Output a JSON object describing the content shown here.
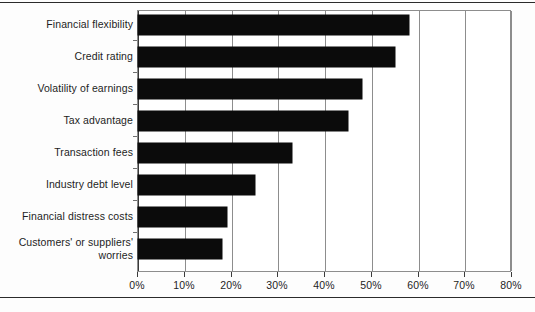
{
  "chart_data": {
    "type": "bar",
    "orientation": "horizontal",
    "title": "",
    "subtitle": "",
    "xlabel": "",
    "ylabel": "",
    "xlim": [
      0,
      80
    ],
    "ylim": null,
    "grid": true,
    "legend": null,
    "legend_position": "none",
    "categories": [
      "Financial flexibility",
      "Credit rating",
      "Volatility of earnings",
      "Tax advantage",
      "Transaction fees",
      "Industry debt level",
      "Financial distress costs",
      "Customers' or suppliers'\nworries"
    ],
    "values": [
      58,
      55,
      48,
      45,
      33,
      25,
      19,
      18
    ],
    "value_unit": "%",
    "xticks": [
      0,
      10,
      20,
      30,
      40,
      50,
      60,
      70,
      80
    ],
    "xtick_labels": [
      "0%",
      "10%",
      "20%",
      "30%",
      "40%",
      "50%",
      "60%",
      "70%",
      "80%"
    ],
    "bar_color": "#0b0b0b",
    "grid_color": "#8d8d8d",
    "axis_color": "#3a3a3a",
    "background_color": "#ffffff"
  }
}
